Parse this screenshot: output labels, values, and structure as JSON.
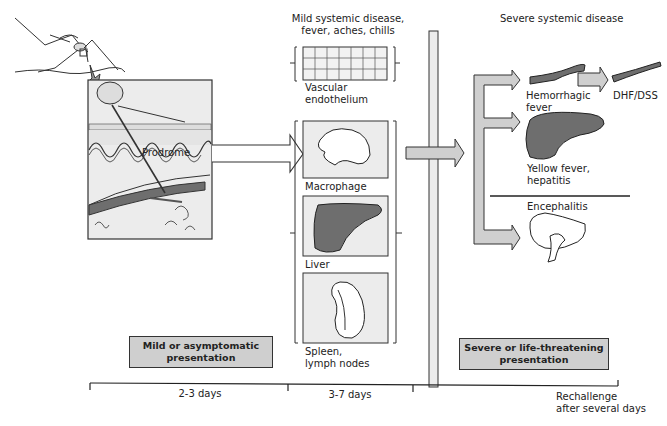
{
  "diagram": {
    "stage1": {
      "prodrome_label": "Prodrome",
      "presentation_box": "Mild or asymptomatic\npresentation",
      "presentation_line1": "Mild or asymptomatic",
      "presentation_line2": "presentation"
    },
    "stage2": {
      "title_line1": "Mild systemic disease,",
      "title_line2": "fever, aches, chills",
      "organs": [
        {
          "label_line1": "Vascular",
          "label_line2": "endothelium"
        },
        {
          "label_line1": "Macrophage",
          "label_line2": ""
        },
        {
          "label_line1": "Liver",
          "label_line2": ""
        },
        {
          "label_line1": "Spleen,",
          "label_line2": "lymph nodes"
        }
      ]
    },
    "stage3": {
      "title": "Severe systemic disease",
      "outcomes": [
        {
          "label_line1": "Hemorrhagic",
          "label_line2": "fever"
        },
        {
          "label_line1": "DHF/DSS",
          "label_line2": ""
        },
        {
          "label_line1": "Yellow fever,",
          "label_line2": "hepatitis"
        },
        {
          "label_line1": "Encephalitis",
          "label_line2": ""
        }
      ],
      "presentation_line1": "Severe or life-threatening",
      "presentation_line2": "presentation"
    },
    "timeline": {
      "segments": [
        {
          "label": "2-3 days"
        },
        {
          "label": "3-7 days"
        }
      ],
      "end_label_line1": "Rechallenge",
      "end_label_line2": "after several days"
    },
    "colors": {
      "fill_gray": "#cfcfcf",
      "dark_gray": "#6e6e6e",
      "light_panel": "#ececec",
      "line": "#333333"
    }
  }
}
